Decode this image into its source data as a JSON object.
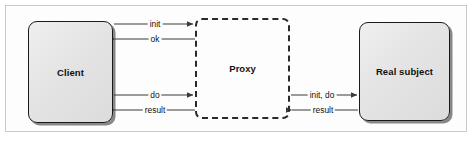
{
  "figure": {
    "type": "sequence-interaction-diagram",
    "background_color": "#ffffff",
    "frame_border_color": "#c9c9c9"
  },
  "nodes": [
    {
      "id": "client",
      "label": "Client",
      "style": "solid-rounded-shadow",
      "fill_color": "#e4e4e4",
      "border_color": "#1a1a1a"
    },
    {
      "id": "proxy",
      "label": "Proxy",
      "style": "dashed-rounded",
      "fill_color": "transparent",
      "border_color": "#2a2a2a"
    },
    {
      "id": "real_subject",
      "label": "Real subject",
      "style": "solid-rounded-shadow",
      "fill_color": "#e4e4e4",
      "border_color": "#1a1a1a"
    }
  ],
  "arrows": [
    {
      "id": "client-to-proxy-init",
      "label": "init",
      "from": "client",
      "to": "proxy",
      "direction": "right"
    },
    {
      "id": "proxy-to-client-ok",
      "label": "ok",
      "from": "proxy",
      "to": "client",
      "direction": "left"
    },
    {
      "id": "client-to-proxy-do",
      "label": "do",
      "from": "client",
      "to": "proxy",
      "direction": "right"
    },
    {
      "id": "proxy-to-client-result",
      "label": "result",
      "from": "proxy",
      "to": "client",
      "direction": "left"
    },
    {
      "id": "proxy-to-real-subject-init-do",
      "label": "init, do",
      "from": "proxy",
      "to": "real_subject",
      "direction": "right"
    },
    {
      "id": "real-subject-to-proxy-result",
      "label": "result",
      "from": "real_subject",
      "to": "proxy",
      "direction": "left"
    }
  ]
}
